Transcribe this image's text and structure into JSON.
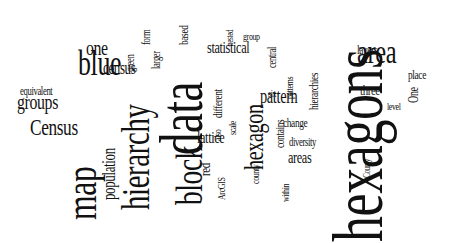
{
  "word_cloud": {
    "words": [
      {
        "text": "hexagons",
        "size": 72,
        "x": 322,
        "y": 242,
        "rot": -90
      },
      {
        "text": "data",
        "size": 62,
        "x": 150,
        "y": 155,
        "rot": -90
      },
      {
        "text": "map",
        "size": 44,
        "x": 60,
        "y": 220,
        "rot": -90
      },
      {
        "text": "hierarchy",
        "size": 40,
        "x": 116,
        "y": 210,
        "rot": -90
      },
      {
        "text": "block",
        "size": 38,
        "x": 170,
        "y": 205,
        "rot": -90
      },
      {
        "text": "area",
        "size": 34,
        "x": 357,
        "y": 64,
        "rot": 0
      },
      {
        "text": "blue",
        "size": 36,
        "x": 78,
        "y": 76,
        "rot": 0
      },
      {
        "text": "hexagon",
        "size": 28,
        "x": 240,
        "y": 170,
        "rot": -90
      },
      {
        "text": "Census",
        "size": 24,
        "x": 30,
        "y": 135,
        "rot": 0
      },
      {
        "text": "groups",
        "size": 22,
        "x": 17,
        "y": 110,
        "rot": 0
      },
      {
        "text": "one",
        "size": 22,
        "x": 86,
        "y": 56,
        "rot": 0
      },
      {
        "text": "pattern",
        "size": 20,
        "x": 260,
        "y": 103,
        "rot": 0
      },
      {
        "text": "population",
        "size": 18,
        "x": 100,
        "y": 200,
        "rot": -90
      },
      {
        "text": "census",
        "size": 18,
        "x": 103,
        "y": 74,
        "rot": 0
      },
      {
        "text": "statistical",
        "size": 17,
        "x": 207,
        "y": 53,
        "rot": 0
      },
      {
        "text": "lattice",
        "size": 17,
        "x": 197,
        "y": 143,
        "rot": 0
      },
      {
        "text": "areas",
        "size": 17,
        "x": 288,
        "y": 163,
        "rot": 0
      },
      {
        "text": "three",
        "size": 15,
        "x": 360,
        "y": 96,
        "rot": 0
      },
      {
        "text": "layers",
        "size": 13,
        "x": 357,
        "y": 54,
        "rot": 0
      },
      {
        "text": "place",
        "size": 13,
        "x": 408,
        "y": 79,
        "rot": 0
      },
      {
        "text": "change",
        "size": 13,
        "x": 283,
        "y": 127,
        "rot": 0
      },
      {
        "text": "diversity",
        "size": 12,
        "x": 289,
        "y": 146,
        "rot": 0
      },
      {
        "text": "equivalent",
        "size": 12,
        "x": 20,
        "y": 95,
        "rot": 0
      },
      {
        "text": "red",
        "size": 15,
        "x": 198,
        "y": 176,
        "rot": -90
      },
      {
        "text": "ArcGIS",
        "size": 11,
        "x": 216,
        "y": 200,
        "rot": -90
      },
      {
        "text": "hierarchies",
        "size": 13,
        "x": 307,
        "y": 110,
        "rot": -90
      },
      {
        "text": "different",
        "size": 13,
        "x": 211,
        "y": 118,
        "rot": -90
      },
      {
        "text": "contains",
        "size": 13,
        "x": 273,
        "y": 148,
        "rot": -90
      },
      {
        "text": "county",
        "size": 11,
        "x": 250,
        "y": 184,
        "rot": -90
      },
      {
        "text": "within",
        "size": 11,
        "x": 280,
        "y": 202,
        "rot": -90
      },
      {
        "text": "also",
        "size": 11,
        "x": 212,
        "y": 141,
        "rot": -90
      },
      {
        "text": "scale",
        "size": 11,
        "x": 227,
        "y": 135,
        "rot": -90
      },
      {
        "text": "larger",
        "size": 12,
        "x": 150,
        "y": 69,
        "rot": -90
      },
      {
        "text": "form",
        "size": 12,
        "x": 140,
        "y": 45,
        "rot": -90
      },
      {
        "text": "green",
        "size": 12,
        "x": 124,
        "y": 72,
        "rot": -90
      },
      {
        "text": "based",
        "size": 13,
        "x": 177,
        "y": 45,
        "rot": -90
      },
      {
        "text": "nested",
        "size": 10,
        "x": 225,
        "y": 46,
        "rot": -90
      },
      {
        "text": "group",
        "size": 11,
        "x": 243,
        "y": 40,
        "rot": 0
      },
      {
        "text": "central",
        "size": 12,
        "x": 266,
        "y": 68,
        "rot": -90
      },
      {
        "text": "patterns",
        "size": 11,
        "x": 284,
        "y": 99,
        "rot": -90
      },
      {
        "text": "six",
        "size": 11,
        "x": 268,
        "y": 97,
        "rot": 0
      },
      {
        "text": "One",
        "size": 14,
        "x": 407,
        "y": 103,
        "rot": -90
      },
      {
        "text": "level",
        "size": 11,
        "x": 387,
        "y": 110,
        "rot": 0
      },
      {
        "text": "County",
        "size": 10,
        "x": 362,
        "y": 178,
        "rot": -90
      }
    ],
    "text_color": "#111111",
    "background": "#ffffff"
  }
}
